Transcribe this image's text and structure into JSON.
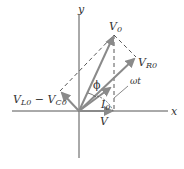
{
  "diagram": {
    "title": "",
    "axes": {
      "x_label": "x",
      "y_label": "y",
      "color": "#555555"
    },
    "phasors": [
      {
        "id": "V0",
        "label_main": "V",
        "label_sub": "0",
        "color": "#8a8a8a"
      },
      {
        "id": "VR0",
        "label_main": "V",
        "label_sub": "R0",
        "color": "#8a8a8a"
      },
      {
        "id": "VL0-VC0",
        "label_main_1": "V",
        "label_sub_1": "L0",
        "minus": " − ",
        "label_main_2": "V",
        "label_sub_2": "C0",
        "color": "#8a8a8a"
      },
      {
        "id": "I0",
        "label_main": "I",
        "label_sub": "0",
        "color": "#8a8a8a"
      },
      {
        "id": "V",
        "label_main": "V",
        "color": "#8a8a8a"
      }
    ],
    "angles": {
      "phi": "ϕ",
      "omega_t": "ωt"
    },
    "dashed_color": "#444444"
  }
}
